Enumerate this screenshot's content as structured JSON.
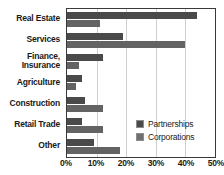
{
  "chart_data": {
    "type": "bar",
    "orientation": "horizontal",
    "title": "",
    "subtitle": "",
    "xlabel": "",
    "ylabel": "",
    "categories": [
      "Real Estate",
      "Services",
      "Finance,\nInsurance",
      "Agriculture",
      "Construction",
      "Retail Trade",
      "Other"
    ],
    "series": [
      {
        "name": "Partnerships",
        "color": "#4a4a4a",
        "values": [
          44,
          19,
          12,
          5,
          6,
          5,
          9
        ]
      },
      {
        "name": "Corporations",
        "color": "#636363",
        "values": [
          11,
          40,
          4,
          3,
          12,
          12,
          18
        ]
      }
    ],
    "xlim": [
      0,
      50
    ],
    "xticks": [
      0,
      10,
      20,
      30,
      40,
      50
    ],
    "xtick_labels": [
      "0%",
      "10%",
      "20%",
      "30%",
      "40%",
      "50%"
    ],
    "grid": true,
    "grid_axis": "x",
    "legend_position": "bottom-right",
    "value_unit": "%"
  },
  "legend": {
    "entries": [
      {
        "label": "Partnerships",
        "swatch": "partnerships-swatch"
      },
      {
        "label": "Corporations",
        "swatch": "corporations-swatch"
      }
    ]
  }
}
